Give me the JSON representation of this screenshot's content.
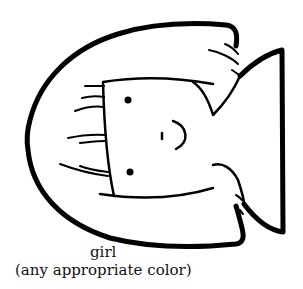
{
  "illustration": {
    "subject": "girl face outline (coloring page, rotated)",
    "stroke_color": "#000000",
    "background_color": "#ffffff"
  },
  "caption": {
    "title": "girl",
    "subtitle": "(any appropriate color)"
  }
}
